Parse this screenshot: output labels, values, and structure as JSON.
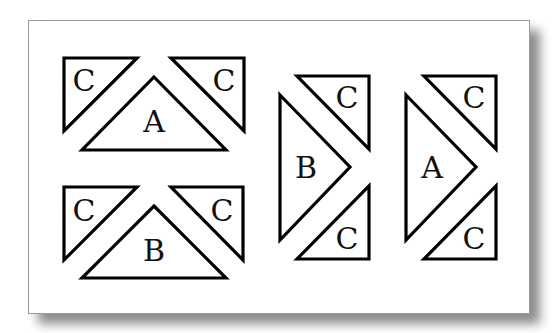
{
  "figure": {
    "colors": {
      "stroke": "#000000",
      "fill": "#ffffff",
      "background": "#ffffff",
      "card_border": "#9a9a9a"
    },
    "units": [
      {
        "id": "unit-top-left",
        "center_label": "A",
        "corner_labels": [
          "C",
          "C"
        ]
      },
      {
        "id": "unit-bottom-left",
        "center_label": "B",
        "corner_labels": [
          "C",
          "C"
        ]
      },
      {
        "id": "unit-right-1",
        "center_label": "B",
        "corner_labels": [
          "C",
          "C"
        ]
      },
      {
        "id": "unit-right-2",
        "center_label": "A",
        "corner_labels": [
          "C",
          "C"
        ]
      }
    ]
  }
}
